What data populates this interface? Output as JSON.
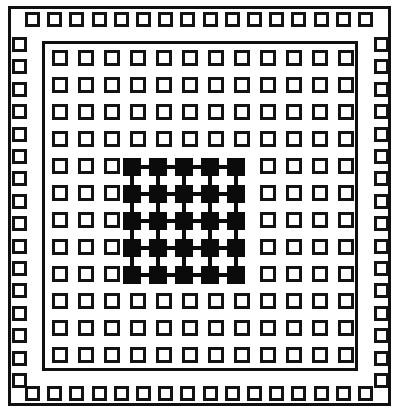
{
  "figure": {
    "colors": {
      "background": "#ffffff",
      "ink": "#101010",
      "pad_outline": "#131313",
      "pad_fill": "#0b0b0b"
    }
  },
  "outer_frame": {
    "name": "package-outline",
    "stroke_width": 3
  },
  "inner_frame": {
    "name": "die-outline",
    "stroke_width": 3
  },
  "peripheral_ring": {
    "name": "peripheral-pad-ring",
    "pads_per_side": 16,
    "sides": [
      "top",
      "right",
      "bottom",
      "left"
    ],
    "pad_state": "hollow",
    "top": {
      "count": 16,
      "x_start": 25,
      "x_pitch": 22.2,
      "y": 12
    },
    "bottom": {
      "count": 16,
      "x_start": 25,
      "x_pitch": 22.2,
      "y": 386
    },
    "left": {
      "count": 16,
      "y_start": 37,
      "y_pitch": 22.4,
      "x": 12
    },
    "right": {
      "count": 16,
      "y_start": 37,
      "y_pitch": 22.4,
      "x": 374
    }
  },
  "pad_array": {
    "name": "inner-pad-array",
    "rows": 12,
    "cols": 12,
    "x_start": 52,
    "y_start": 50,
    "x_pitch": 26.0,
    "y_pitch": 27.0,
    "pad_state": "hollow"
  },
  "bumped_block": {
    "name": "filled-pad-block",
    "rows": 5,
    "cols": 5,
    "row_start_index": 4,
    "col_start_index": 3,
    "x_start": 123,
    "y_start": 158,
    "x_pitch": 26.0,
    "y_pitch": 27.0,
    "pad_state": "filled",
    "traces": {
      "name": "interconnect-traces",
      "horizontal_runs": 5,
      "vertical_runs": 5,
      "stroke_width": 4
    }
  }
}
